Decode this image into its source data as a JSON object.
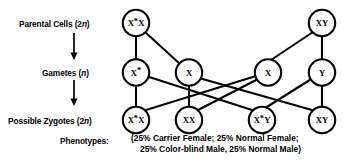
{
  "diagram": {
    "title_rows": [
      {
        "id": "parental",
        "text_main": "Parental Cells (2",
        "ital": "n",
        "text_tail": ")"
      },
      {
        "id": "gametes",
        "text_main": "Gametes (",
        "ital": "n",
        "text_tail": ")"
      },
      {
        "id": "zygotes",
        "text_main": "Possible Zygotes (2",
        "ital": "n",
        "text_tail": ")"
      }
    ],
    "phenotypes_label": "Phenotypes:",
    "rows": {
      "parental": {
        "label": "Parental Cells (2n)",
        "nodes": [
          {
            "id": "p-female",
            "base": "X",
            "sup": "*",
            "suffix": "X",
            "full": "X*X"
          },
          {
            "id": "p-male",
            "base": "XY",
            "sup": "",
            "suffix": "",
            "full": "XY"
          }
        ]
      },
      "gametes": {
        "label": "Gametes (n)",
        "nodes": [
          {
            "id": "g-xstar",
            "base": "X",
            "sup": "*",
            "suffix": "",
            "full": "X*"
          },
          {
            "id": "g-x1",
            "base": "X",
            "sup": "",
            "suffix": "",
            "full": "X"
          },
          {
            "id": "g-x2",
            "base": "X",
            "sup": "",
            "suffix": "",
            "full": "X"
          },
          {
            "id": "g-y",
            "base": "Y",
            "sup": "",
            "suffix": "",
            "full": "Y"
          }
        ]
      },
      "zygotes": {
        "label": "Possible Zygotes (2n)",
        "nodes": [
          {
            "id": "z-carrier-female",
            "base": "X",
            "sup": "*",
            "suffix": "X",
            "full": "X*X"
          },
          {
            "id": "z-normal-female",
            "base": "XX",
            "sup": "",
            "suffix": "",
            "full": "XX"
          },
          {
            "id": "z-colorblind-male",
            "base": "X",
            "sup": "*",
            "suffix": "Y",
            "full": "X*Y"
          },
          {
            "id": "z-normal-male",
            "base": "XY",
            "sup": "",
            "suffix": "",
            "full": "XY"
          }
        ]
      }
    },
    "phenotypes_lines": [
      "(25% Carrier Female; 25% Normal Female;",
      "25% Color-blind Male, 25% Normal Male)"
    ],
    "colors": {
      "stroke": "#000000",
      "background": "#ffffff",
      "text": "#000000"
    }
  }
}
